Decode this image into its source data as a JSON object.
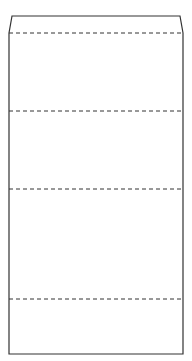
{
  "diagram": {
    "type": "segmented-box",
    "stroke_color": "#333333",
    "dash_color": "#333333",
    "background": "#ffffff",
    "outline": {
      "top_left": [
        12,
        16
      ],
      "top_right": [
        180,
        16
      ],
      "shoulder_left": [
        9,
        33
      ],
      "shoulder_right": [
        183,
        33
      ],
      "bottom_left": [
        9,
        354
      ],
      "bottom_right": [
        183,
        354
      ]
    },
    "dashed_dividers_y": [
      33,
      111,
      189,
      299
    ],
    "sections": [
      {
        "name": "header-cap",
        "top": 16,
        "bottom": 33,
        "label": ""
      },
      {
        "name": "section-1",
        "top": 33,
        "bottom": 111,
        "label": ""
      },
      {
        "name": "section-2",
        "top": 111,
        "bottom": 189,
        "label": ""
      },
      {
        "name": "section-3",
        "top": 189,
        "bottom": 299,
        "label": ""
      },
      {
        "name": "section-4",
        "top": 299,
        "bottom": 354,
        "label": ""
      }
    ]
  }
}
